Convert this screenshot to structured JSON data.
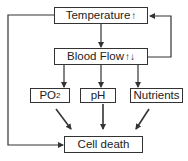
{
  "diagram": {
    "nodes": {
      "temperature": {
        "label": "Temperature",
        "indicator": "↑"
      },
      "blood_flow": {
        "label": "Blood Flow",
        "indicator": "↑↓"
      },
      "po2": {
        "label": "PO",
        "subscript": "2"
      },
      "ph": {
        "label": "pH"
      },
      "nutrients": {
        "label": "Nutrients"
      },
      "cell_death": {
        "label": "Cell death"
      }
    },
    "edges": [
      {
        "from": "temperature",
        "to": "blood_flow"
      },
      {
        "from": "blood_flow",
        "to": "temperature",
        "type": "feedback"
      },
      {
        "from": "blood_flow",
        "to": "po2"
      },
      {
        "from": "blood_flow",
        "to": "ph"
      },
      {
        "from": "blood_flow",
        "to": "nutrients"
      },
      {
        "from": "po2",
        "to": "cell_death"
      },
      {
        "from": "ph",
        "to": "cell_death"
      },
      {
        "from": "nutrients",
        "to": "cell_death"
      },
      {
        "from": "temperature",
        "to": "cell_death"
      }
    ],
    "colors": {
      "line": "#333333",
      "box_fill": "#ffffff"
    }
  }
}
